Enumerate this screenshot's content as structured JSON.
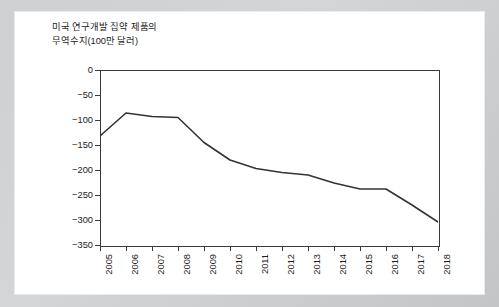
{
  "chart_data": {
    "type": "line",
    "title": "미국 연구개발 집약 제품의\n무역수지(100만 달러)",
    "title_line1": "미국 연구개발 집약 제품의",
    "title_line2": "무역수지(100만 달러)",
    "xlabel": "",
    "ylabel": "",
    "categories": [
      "2005",
      "2006",
      "2007",
      "2008",
      "2009",
      "2010",
      "2011",
      "2012",
      "2013",
      "2014",
      "2015",
      "2016",
      "2017",
      "2018"
    ],
    "values": [
      -132,
      -86,
      -93,
      -95,
      -145,
      -180,
      -197,
      -205,
      -210,
      -226,
      -238,
      -238,
      -270,
      -304
    ],
    "series": [
      {
        "name": "미국 연구개발 집약 제품의 무역수지",
        "values": [
          -132,
          -86,
          -93,
          -95,
          -145,
          -180,
          -197,
          -205,
          -210,
          -226,
          -238,
          -238,
          -270,
          -304
        ]
      }
    ],
    "ylim": [
      -350,
      0
    ],
    "yticks": [
      0,
      -50,
      -100,
      -150,
      -200,
      -250,
      -300,
      -350
    ],
    "ytick_labels": [
      "0",
      "-50",
      "-100",
      "-150",
      "-200",
      "-250",
      "-300",
      "-350"
    ],
    "xtick_rotation": -90,
    "grid": false,
    "legend": false,
    "legend_position": "none",
    "line_color": "#333333",
    "line_width": 1.6,
    "markers": false,
    "plot_background": "#ffffff",
    "axis_color": "#3a3a3a"
  },
  "figure": {
    "frame_color": "#cfd0d1",
    "card_color": "#ffffff"
  }
}
